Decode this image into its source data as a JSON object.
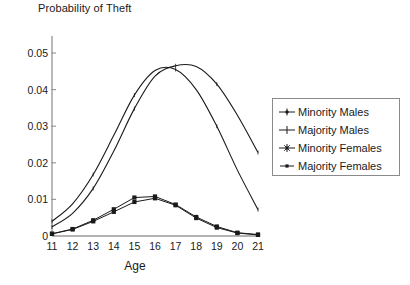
{
  "chart_data": {
    "type": "line",
    "title": "Probability of Theft",
    "xlabel": "Age",
    "ylabel": "",
    "x": [
      11,
      12,
      13,
      14,
      15,
      16,
      17,
      18,
      19,
      20,
      21
    ],
    "xticklabels": [
      "11",
      "12",
      "13",
      "14",
      "15",
      "16",
      "17",
      "18",
      "19",
      "20",
      "21"
    ],
    "yticklabels": [
      "0",
      "0.01",
      "0.02",
      "0.03",
      "0.04",
      "0.05"
    ],
    "yticks": [
      0,
      0.01,
      0.02,
      0.03,
      0.04,
      0.05
    ],
    "xlim": [
      11,
      21
    ],
    "ylim": [
      0,
      0.055
    ],
    "grid": false,
    "legend_position": "right",
    "series": [
      {
        "name": "Minority Males",
        "marker": "plus-dot",
        "values": [
          0.004,
          0.0088,
          0.0168,
          0.0275,
          0.0385,
          0.0452,
          0.0455,
          0.04,
          0.03,
          0.018,
          0.0072
        ]
      },
      {
        "name": "Majority Males",
        "marker": "plus",
        "values": [
          0.0025,
          0.0062,
          0.013,
          0.0232,
          0.0348,
          0.0437,
          0.0465,
          0.0463,
          0.0415,
          0.033,
          0.0228
        ]
      },
      {
        "name": "Minority Females",
        "marker": "star-square",
        "values": [
          0.0006,
          0.0019,
          0.0043,
          0.0073,
          0.0105,
          0.0108,
          0.0086,
          0.0052,
          0.0026,
          0.0009,
          0.0004
        ]
      },
      {
        "name": "Majority Females",
        "marker": "square",
        "values": [
          0.0006,
          0.0018,
          0.004,
          0.0066,
          0.0093,
          0.0103,
          0.0084,
          0.0049,
          0.0023,
          0.0008,
          0.0003
        ]
      }
    ]
  },
  "legend": {
    "entries": [
      {
        "label": "Minority Males"
      },
      {
        "label": "Majority Males"
      },
      {
        "label": "Minority Females"
      },
      {
        "label": "Majority Females"
      }
    ]
  },
  "colors": {
    "line": "#1a1a1a",
    "axis": "#9a9a9a",
    "text": "#1a1a1a",
    "background": "#ffffff",
    "legend_border": "#8a8a8a"
  }
}
